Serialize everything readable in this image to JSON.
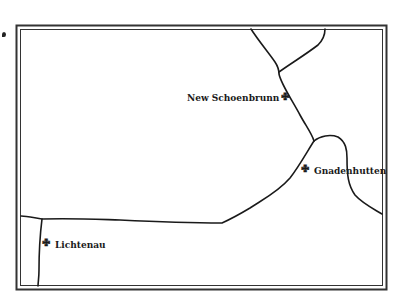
{
  "map": {
    "frame_color": "#333333",
    "line_color": "#1a1a1a",
    "places": [
      {
        "name": "New Schoenbrunn",
        "icon": "cross-icon",
        "label_side": "left"
      },
      {
        "name": "Gnadenhutten",
        "icon": "cross-icon",
        "label_side": "right"
      },
      {
        "name": "Lichtenau",
        "icon": "cross-icon",
        "label_side": "right"
      }
    ],
    "cross_glyph": "✙"
  }
}
